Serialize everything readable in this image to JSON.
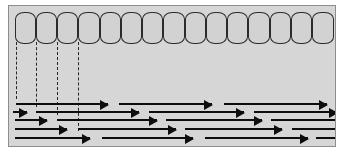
{
  "figure": {
    "panel": {
      "background_color": "#d6d6d6",
      "border_color": "#8d8d8d",
      "x": 8,
      "y": 5,
      "width": 328,
      "height": 142
    }
  },
  "cell_layer": {
    "name": "epithelial-cell-row",
    "count": 15,
    "fill_color": "#d2d2d2",
    "stroke_color": "#2b2b2b",
    "y": 6,
    "height": 32,
    "cells": [
      {
        "index": 1,
        "x": 6,
        "width": 21
      },
      {
        "index": 2,
        "x": 27,
        "width": 21
      },
      {
        "index": 3,
        "x": 48,
        "width": 21
      },
      {
        "index": 4,
        "x": 69,
        "width": 22
      },
      {
        "index": 5,
        "x": 91,
        "width": 21
      },
      {
        "index": 6,
        "x": 112,
        "width": 21
      },
      {
        "index": 7,
        "x": 133,
        "width": 21
      },
      {
        "index": 8,
        "x": 154,
        "width": 22
      },
      {
        "index": 9,
        "x": 176,
        "width": 21
      },
      {
        "index": 10,
        "x": 197,
        "width": 21
      },
      {
        "index": 11,
        "x": 218,
        "width": 21
      },
      {
        "index": 12,
        "x": 239,
        "width": 22
      },
      {
        "index": 13,
        "x": 261,
        "width": 21
      },
      {
        "index": 14,
        "x": 282,
        "width": 21
      },
      {
        "index": 15,
        "x": 303,
        "width": 22
      }
    ]
  },
  "drop_lines": {
    "name": "cell-boundary-drop-lines",
    "count": 4,
    "style": "dashed",
    "color": "#262626",
    "top": 36,
    "lines": [
      {
        "index": 1,
        "x": 7,
        "bottom": 93
      },
      {
        "index": 2,
        "x": 27,
        "bottom": 101
      },
      {
        "index": 3,
        "x": 48,
        "bottom": 109
      },
      {
        "index": 4,
        "x": 69,
        "bottom": 125
      }
    ]
  },
  "arrow_field": {
    "name": "flow-arrow-field",
    "color": "#0d0d0d",
    "row_count": 5,
    "rows": [
      {
        "index": 1,
        "y": 93,
        "arrows": [
          {
            "x": 7,
            "width": 92,
            "tip": true
          },
          {
            "x": 110,
            "width": 93,
            "tip": true
          },
          {
            "x": 215,
            "width": 103,
            "tip": true
          }
        ]
      },
      {
        "index": 2,
        "y": 101,
        "arrows": [
          {
            "x": 4,
            "width": 14,
            "tip": true
          },
          {
            "x": 27,
            "width": 103,
            "tip": true
          },
          {
            "x": 140,
            "width": 95,
            "tip": true
          },
          {
            "x": 245,
            "width": 83,
            "tip": true
          }
        ]
      },
      {
        "index": 3,
        "y": 109,
        "arrows": [
          {
            "x": 6,
            "width": 32,
            "tip": true
          },
          {
            "x": 48,
            "width": 100,
            "tip": true
          },
          {
            "x": 157,
            "width": 96,
            "tip": true
          },
          {
            "x": 262,
            "width": 66,
            "tip": false
          }
        ]
      },
      {
        "index": 4,
        "y": 118,
        "arrows": [
          {
            "x": 6,
            "width": 52,
            "tip": true
          },
          {
            "x": 69,
            "width": 98,
            "tip": true
          },
          {
            "x": 176,
            "width": 97,
            "tip": true
          },
          {
            "x": 283,
            "width": 45,
            "tip": false
          }
        ]
      },
      {
        "index": 5,
        "y": 127,
        "arrows": [
          {
            "x": 6,
            "width": 75,
            "tip": true
          },
          {
            "x": 93,
            "width": 91,
            "tip": true
          },
          {
            "x": 196,
            "width": 103,
            "tip": true
          },
          {
            "x": 307,
            "width": 21,
            "tip": false
          }
        ]
      }
    ]
  }
}
